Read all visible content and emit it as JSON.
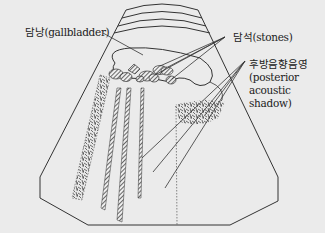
{
  "diagram": {
    "type": "ultrasound-schematic",
    "labels": {
      "gallbladder": "담낭(gallbladder)",
      "stones": "담석(stones)",
      "shadow_ko": "후방음향음영",
      "shadow_en_1": "(posterior",
      "shadow_en_2": "acoustic",
      "shadow_en_3": "shadow)"
    },
    "colors": {
      "background": "#ebebeb",
      "stroke": "#333333",
      "fill_dark": "#555555"
    }
  }
}
